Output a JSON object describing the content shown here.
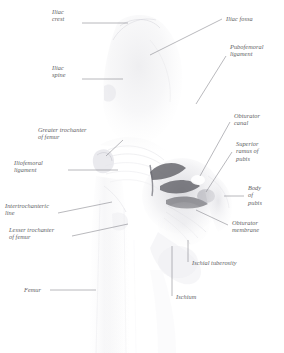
{
  "figure": {
    "style": "faded watercolour anatomical plate",
    "ink_color": "#5d5d62",
    "leader_color": "#7e7e86",
    "background_color": "#ffffff"
  },
  "labels": {
    "iliac_crest": "Iliac\ncrest",
    "iliac_spine": "Iliac\nspine",
    "greater_trochanter": "Greater trochanter\nof femur",
    "iliofemoral_ligament": "Iliofemoral\nligament",
    "intertrochanteric_line": "Intertrochanteric\nline",
    "lesser_trochanter": "Lesser trochanter\nof femur",
    "femur": "Femur",
    "iliac_fossa": "Iliac fossa",
    "pubofemoral_ligament": "Pubofemoral\nligament",
    "obturator_canal": "Obturator\ncanal",
    "superior_ramus_of_pubis": "Superior\nramus of\npubis",
    "body_of_pubis": "Body\nof\npubis",
    "obturator_membrane": "Obturator\nmembrane",
    "ischial_tuberosity": "Ischial tuberosity",
    "ischium": "Ischium"
  }
}
